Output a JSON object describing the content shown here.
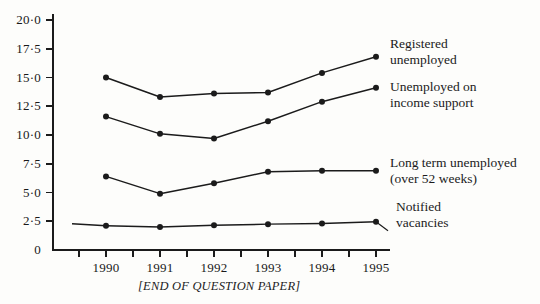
{
  "footer": {
    "text": "[END OF QUESTION PAPER]"
  },
  "chart_data": {
    "type": "line",
    "title": "",
    "xlabel": "",
    "ylabel": "",
    "categories": [
      "1990",
      "1991",
      "1992",
      "1993",
      "1994",
      "1995"
    ],
    "x": [
      1990,
      1991,
      1992,
      1993,
      1994,
      1995
    ],
    "ylim": [
      0,
      20
    ],
    "xlim": [
      1989.5,
      1995.5
    ],
    "grid": false,
    "legend_position": "right-inline-labels",
    "ytick_labels": [
      "0",
      "2·5",
      "5·0",
      "7·5",
      "10·0",
      "12·5",
      "15·0",
      "17·5",
      "20·0"
    ],
    "ytick_values": [
      0,
      2.5,
      5,
      7.5,
      10,
      12.5,
      15,
      17.5,
      20
    ],
    "xtick_labels": [
      "1990",
      "1991",
      "1992",
      "1993",
      "1994",
      "1995"
    ],
    "minor_xticks": true,
    "series": [
      {
        "name": "Registered unemployed",
        "label_lines": [
          "Registered",
          "unemployed"
        ],
        "values": [
          15.0,
          13.3,
          13.6,
          13.7,
          15.4,
          16.8
        ],
        "color": "#1b1b1b"
      },
      {
        "name": "Unemployed on income support",
        "label_lines": [
          "Unemployed on",
          "income support"
        ],
        "values": [
          11.6,
          10.1,
          9.7,
          11.2,
          12.9,
          14.1
        ],
        "color": "#1b1b1b"
      },
      {
        "name": "Long term unemployed (over 52 weeks)",
        "label_lines": [
          "Long term unemployed",
          "(over 52 weeks)"
        ],
        "values": [
          6.4,
          4.9,
          5.8,
          6.8,
          6.9,
          6.9
        ],
        "color": "#1b1b1b"
      },
      {
        "name": "Notified vacancies",
        "label_lines": [
          "Notified",
          "vacancies"
        ],
        "values": [
          2.1,
          2.0,
          2.15,
          2.25,
          2.3,
          2.45
        ],
        "color": "#1b1b1b"
      }
    ]
  }
}
